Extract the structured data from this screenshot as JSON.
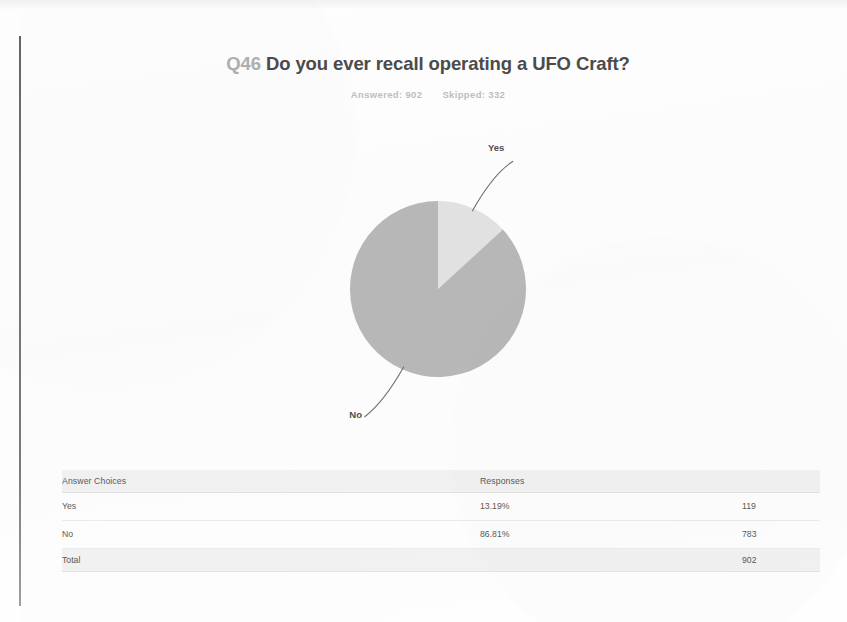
{
  "document": {
    "kind": "survey-results-page",
    "background_color": "#fefefe"
  },
  "header": {
    "question_number": "Q46",
    "question_text": "Do you ever recall operating a UFO Craft?",
    "answered_label": "Answered:",
    "answered_count": "902",
    "skipped_label": "Skipped:",
    "skipped_count": "332"
  },
  "chart_data": {
    "type": "pie",
    "title": "Q46 Do you ever recall operating a UFO Craft?",
    "subtitle": "Answered: 902   Skipped: 332",
    "labels": [
      "Yes",
      "No"
    ],
    "values": [
      13.19,
      86.81
    ],
    "counts": [
      119,
      783
    ],
    "total": 902,
    "units": "percent",
    "start_angle_deg": 0,
    "direction": "clockwise",
    "grid": false,
    "legend": "none",
    "data_labels": "leader-lines",
    "slice_colors": [
      "#e3e3e3",
      "#b9b9b9"
    ],
    "annotations": [
      {
        "label": "Yes",
        "position": "upper-right"
      },
      {
        "label": "No",
        "position": "lower-left"
      }
    ]
  },
  "table": {
    "columns": [
      "Answer Choices",
      "Responses",
      ""
    ],
    "rows": [
      {
        "choice": "Yes",
        "percent": "13.19%",
        "count": "119"
      },
      {
        "choice": "No",
        "percent": "86.81%",
        "count": "783"
      }
    ],
    "total_label": "Total",
    "total_count": "902"
  }
}
